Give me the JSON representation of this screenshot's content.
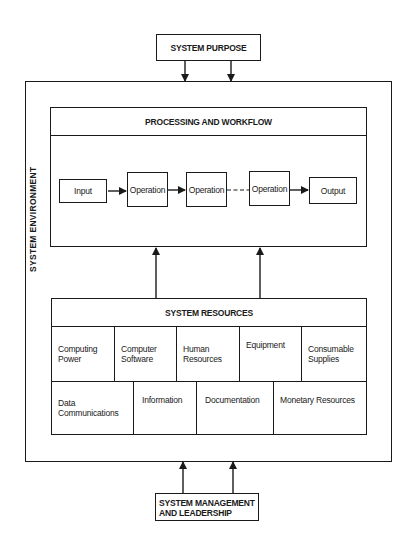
{
  "diagram": {
    "purpose": "SYSTEM PURPOSE",
    "environment": "SYSTEM ENVIRONMENT",
    "processing": {
      "title": "PROCESSING AND WORKFLOW",
      "steps": [
        "Input",
        "Operation",
        "Operation",
        "Operation",
        "Output"
      ]
    },
    "resources": {
      "title": "SYSTEM RESOURCES",
      "row1": [
        "Computing Power",
        "Computer Software",
        "Human Resources",
        "Equipment",
        "Consumable Supplies"
      ],
      "row2": [
        "Data Communications",
        "Information",
        "Documentation",
        "Monetary Resources"
      ]
    },
    "management": {
      "line1": "SYSTEM MANAGEMENT",
      "line2": "AND LEADERSHIP"
    }
  }
}
